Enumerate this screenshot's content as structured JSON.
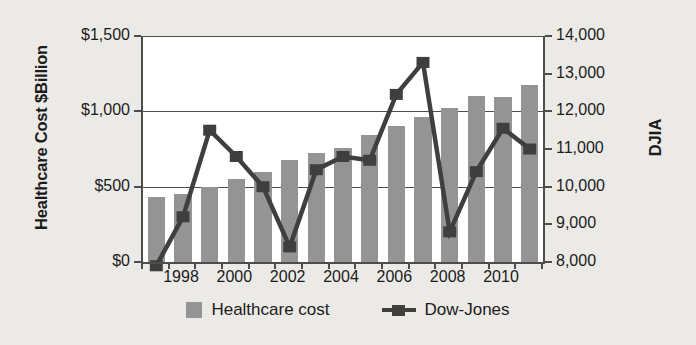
{
  "chart_data": {
    "type": "bar",
    "title": "",
    "subtitle": "",
    "xlabel": "",
    "ylabel": "Healthcare Cost $Billion",
    "y2label": "DJIA",
    "grid": true,
    "legend_position": "bottom",
    "x": [
      1997,
      1998,
      1999,
      2000,
      2001,
      2002,
      2003,
      2004,
      2005,
      2006,
      2007,
      2008,
      2009,
      2010,
      2011
    ],
    "categories": [
      "1997",
      "1998",
      "1999",
      "2000",
      "2001",
      "2002",
      "2003",
      "2004",
      "2005",
      "2006",
      "2007",
      "2008",
      "2009",
      "2010",
      "2011"
    ],
    "xtick_labels": [
      "1998",
      "2000",
      "2002",
      "2004",
      "2006",
      "2008",
      "2010"
    ],
    "xtick_values": [
      1998,
      2000,
      2002,
      2004,
      2006,
      2008,
      2010
    ],
    "ylim": [
      0,
      1500
    ],
    "ytick_labels": [
      "$0",
      "$500",
      "$1,000",
      "$1,500"
    ],
    "ytick_values": [
      0,
      500,
      1000,
      1500
    ],
    "y2lim": [
      8000,
      14000
    ],
    "y2tick_labels": [
      "8,000",
      "9,000",
      "10,000",
      "11,000",
      "12,000",
      "13,000",
      "14,000"
    ],
    "y2tick_values": [
      8000,
      9000,
      10000,
      11000,
      12000,
      13000,
      14000
    ],
    "series": [
      {
        "name": "Healthcare cost",
        "kind": "bar",
        "axis": "left",
        "color": "#949494",
        "values": [
          430,
          450,
          500,
          550,
          600,
          675,
          725,
          755,
          845,
          900,
          965,
          1020,
          1100,
          1095,
          1175
        ]
      },
      {
        "name": "Dow-Jones",
        "kind": "line",
        "axis": "right",
        "color": "#3f3f3f",
        "values": [
          7900,
          9200,
          11500,
          10800,
          10000,
          8400,
          10450,
          10800,
          10700,
          12450,
          13300,
          8800,
          10400,
          11550,
          11000
        ]
      }
    ]
  },
  "legend": {
    "items": [
      {
        "label": "Healthcare cost",
        "marker": "square-swatch"
      },
      {
        "label": "Dow-Jones",
        "marker": "line-square-marker"
      }
    ]
  },
  "colors": {
    "background": "#eceae7",
    "plot_background": "#ffffff",
    "axis": "#4d4d4d",
    "bar": "#949494",
    "line": "#3f3f3f",
    "text": "#1b1b1b"
  }
}
